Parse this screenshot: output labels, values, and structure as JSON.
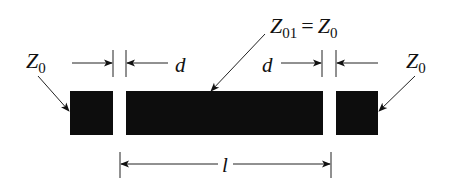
{
  "diagram": {
    "type": "microstrip gap-coupled resonator",
    "colors": {
      "conductor": "#0d0d0d",
      "line": "#222222",
      "background": "#ffffff"
    },
    "labels": {
      "left_port": {
        "symbol": "Z",
        "subscript": "0"
      },
      "right_port": {
        "symbol": "Z",
        "subscript": "0"
      },
      "resonator": {
        "symbol": "Z",
        "subscript": "01",
        "equals": "=",
        "rhs_symbol": "Z",
        "rhs_subscript": "0"
      },
      "gap_left": "d",
      "gap_right": "d",
      "length": "l"
    },
    "elements": [
      {
        "name": "left-feed-line",
        "label": "Z0"
      },
      {
        "name": "resonator-section",
        "label": "Z01 = Z0"
      },
      {
        "name": "right-feed-line",
        "label": "Z0"
      }
    ]
  }
}
